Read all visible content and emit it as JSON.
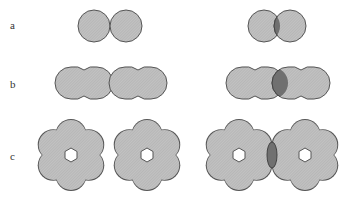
{
  "rows": [
    {
      "label": "a",
      "label_y": 19,
      "description": "two single circles: touching (left), overlapping (right)"
    },
    {
      "label": "b",
      "label_y": 78,
      "description": "two double-circle pairs: touching (left), overlapping (right)"
    },
    {
      "label": "c",
      "label_y": 150,
      "description": "two six-lobed rings with hexagonal holes: touching (left), overlapping (right)"
    }
  ],
  "colors": {
    "fill": "#bdbdbd",
    "overlap": "#6e6e6e",
    "stroke": "#555555",
    "hole": "#ffffff"
  }
}
